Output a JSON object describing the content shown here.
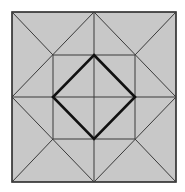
{
  "diagram": {
    "type": "geometric-figure",
    "colors": {
      "fill": "#c8c8c8",
      "thin_line": "#3a3a3a",
      "bold_line": "#111111",
      "background": "#ffffff"
    },
    "outer_square": {
      "x1": 12,
      "y1": 12,
      "x2": 176,
      "y2": 182
    },
    "inner_square": {
      "x1": 53,
      "y1": 55,
      "x2": 135,
      "y2": 139
    },
    "center": {
      "x": 94,
      "y": 97
    },
    "diamond": [
      [
        94,
        55
      ],
      [
        135,
        97
      ],
      [
        94,
        139
      ],
      [
        53,
        97
      ]
    ]
  }
}
